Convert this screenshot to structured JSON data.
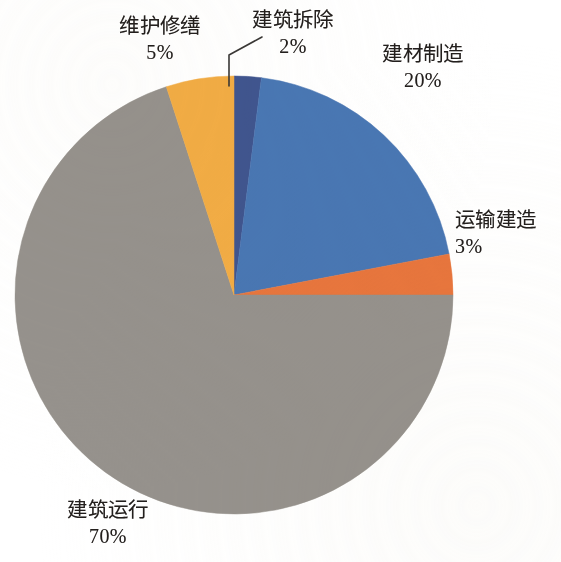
{
  "chart_data": {
    "type": "pie",
    "title": "",
    "subtitle": "",
    "xlabel": "",
    "ylabel": "",
    "legend_position": "none",
    "grid": false,
    "labels_inside": false,
    "units": "percent",
    "start_angle_deg": 0,
    "direction": "clockwise",
    "categories": [
      "建筑拆除",
      "建材制造",
      "运输建造",
      "建筑运行",
      "维护修缮"
    ],
    "values": [
      2,
      20,
      3,
      70,
      5
    ],
    "slices": [
      {
        "label": "建筑拆除",
        "value": 2,
        "value_text": "2%",
        "color": "#41558f",
        "start_deg": 0,
        "end_deg": 7.2,
        "has_leader_line": true
      },
      {
        "label": "建材制造",
        "value": 20,
        "value_text": "20%",
        "color": "#4a77b4",
        "start_deg": 7.2,
        "end_deg": 79.2,
        "has_leader_line": false
      },
      {
        "label": "运输建造",
        "value": 3,
        "value_text": "3%",
        "color": "#e8763c",
        "start_deg": 79.2,
        "end_deg": 90.0,
        "has_leader_line": false
      },
      {
        "label": "建筑运行",
        "value": 70,
        "value_text": "70%",
        "color": "#96928d",
        "start_deg": 90.0,
        "end_deg": 342.0,
        "has_leader_line": false
      },
      {
        "label": "维护修缮",
        "value": 5,
        "value_text": "5%",
        "color": "#f2ad45",
        "start_deg": 342.0,
        "end_deg": 360.0,
        "has_leader_line": false
      }
    ]
  },
  "labels": {
    "weihu": {
      "name": "维护修缮",
      "pct": "5%"
    },
    "chaichu": {
      "name": "建筑拆除",
      "pct": "2%"
    },
    "zhicao": {
      "name": "建材制造",
      "pct": "20%"
    },
    "yunshu": {
      "name": "运输建造",
      "pct": "3%"
    },
    "yunxing": {
      "name": "建筑运行",
      "pct": "70%"
    }
  },
  "colors": {
    "demolition": "#41558f",
    "materials": "#4a77b4",
    "transport": "#e8763c",
    "operation": "#96928d",
    "maintenance": "#f2ad45",
    "text": "#231f1d",
    "leader_line": "#3a3836",
    "background": "#ffffff"
  }
}
